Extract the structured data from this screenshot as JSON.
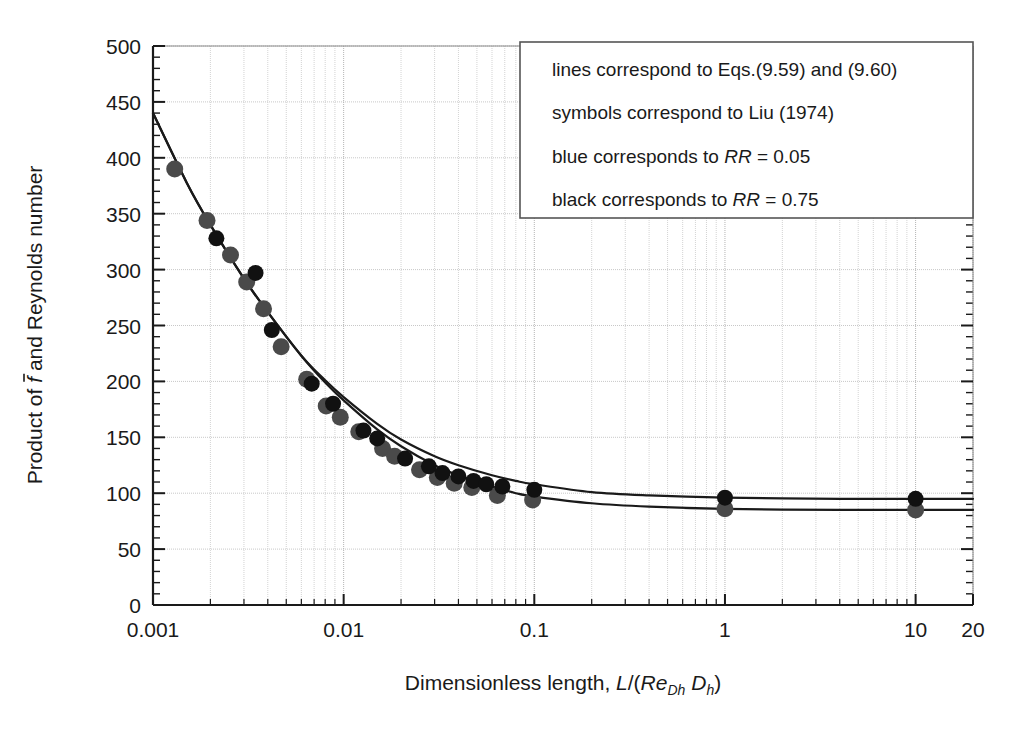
{
  "figure": {
    "background": "#ffffff",
    "plot_area": {
      "left": 153,
      "top": 46,
      "right": 973,
      "bottom": 605
    }
  },
  "chart_data": {
    "type": "scatter",
    "title": "",
    "xlabel": "Dimensionless length, L/(Re_Dh D_h)",
    "ylabel": "Product of f-bar and Reynolds number",
    "xscale": "log",
    "xlim": [
      0.001,
      20
    ],
    "ylim": [
      0,
      500
    ],
    "yticks": [
      0,
      50,
      100,
      150,
      200,
      250,
      300,
      350,
      400,
      450,
      500
    ],
    "ytick_labels": [
      "0",
      "50",
      "100",
      "150",
      "200",
      "250",
      "300",
      "350",
      "400",
      "450",
      "500"
    ],
    "xticks": [
      0.001,
      0.01,
      0.1,
      1,
      10,
      20
    ],
    "xtick_labels": [
      "0.001",
      "0.01",
      "0.1",
      "1",
      "10",
      "20"
    ],
    "grid": true,
    "grid_style": "dotted",
    "grid_color": "#c8c8c8",
    "minor_ticks": true,
    "legend_position": "top-right",
    "series": [
      {
        "name": "RR = 0.05",
        "label": "blue corresponds to RR = 0.05",
        "color": "#4a4a4a",
        "marker": "circle",
        "marker_size": 17,
        "line_color": "#1a1a1a",
        "points": [
          {
            "x": 0.0013,
            "y": 390
          },
          {
            "x": 0.00192,
            "y": 344
          },
          {
            "x": 0.00255,
            "y": 313
          },
          {
            "x": 0.0031,
            "y": 289
          },
          {
            "x": 0.0038,
            "y": 265
          },
          {
            "x": 0.0047,
            "y": 231
          },
          {
            "x": 0.0064,
            "y": 202
          },
          {
            "x": 0.0081,
            "y": 178
          },
          {
            "x": 0.0096,
            "y": 168
          },
          {
            "x": 0.012,
            "y": 155
          },
          {
            "x": 0.016,
            "y": 140
          },
          {
            "x": 0.0185,
            "y": 133
          },
          {
            "x": 0.025,
            "y": 121
          },
          {
            "x": 0.031,
            "y": 114
          },
          {
            "x": 0.038,
            "y": 109
          },
          {
            "x": 0.047,
            "y": 105
          },
          {
            "x": 0.064,
            "y": 98
          },
          {
            "x": 0.098,
            "y": 94
          },
          {
            "x": 1.0,
            "y": 86
          },
          {
            "x": 10.0,
            "y": 85
          }
        ],
        "curve": [
          {
            "x": 0.001,
            "y": 440
          },
          {
            "x": 0.0015,
            "y": 378
          },
          {
            "x": 0.002,
            "y": 340
          },
          {
            "x": 0.003,
            "y": 292
          },
          {
            "x": 0.004,
            "y": 262
          },
          {
            "x": 0.006,
            "y": 223
          },
          {
            "x": 0.008,
            "y": 199
          },
          {
            "x": 0.01,
            "y": 183
          },
          {
            "x": 0.015,
            "y": 157
          },
          {
            "x": 0.02,
            "y": 142
          },
          {
            "x": 0.03,
            "y": 125
          },
          {
            "x": 0.04,
            "y": 116
          },
          {
            "x": 0.06,
            "y": 106
          },
          {
            "x": 0.08,
            "y": 100
          },
          {
            "x": 0.1,
            "y": 97
          },
          {
            "x": 0.2,
            "y": 91
          },
          {
            "x": 0.4,
            "y": 88
          },
          {
            "x": 1.0,
            "y": 86
          },
          {
            "x": 4.0,
            "y": 85
          },
          {
            "x": 10.0,
            "y": 85
          },
          {
            "x": 20.0,
            "y": 85
          }
        ]
      },
      {
        "name": "RR = 0.75",
        "label": "black corresponds to RR = 0.75",
        "color": "#111111",
        "marker": "circle",
        "marker_size": 16,
        "line_color": "#1a1a1a",
        "points": [
          {
            "x": 0.00215,
            "y": 328
          },
          {
            "x": 0.00345,
            "y": 297
          },
          {
            "x": 0.0042,
            "y": 246
          },
          {
            "x": 0.0068,
            "y": 198
          },
          {
            "x": 0.0088,
            "y": 180
          },
          {
            "x": 0.0127,
            "y": 156
          },
          {
            "x": 0.015,
            "y": 149
          },
          {
            "x": 0.021,
            "y": 131
          },
          {
            "x": 0.028,
            "y": 124
          },
          {
            "x": 0.033,
            "y": 118
          },
          {
            "x": 0.04,
            "y": 115
          },
          {
            "x": 0.048,
            "y": 111
          },
          {
            "x": 0.056,
            "y": 108
          },
          {
            "x": 0.068,
            "y": 106
          },
          {
            "x": 0.1,
            "y": 103
          },
          {
            "x": 1.0,
            "y": 96
          },
          {
            "x": 10.0,
            "y": 95
          }
        ],
        "curve": [
          {
            "x": 0.001,
            "y": 440
          },
          {
            "x": 0.0015,
            "y": 378
          },
          {
            "x": 0.002,
            "y": 340
          },
          {
            "x": 0.003,
            "y": 292
          },
          {
            "x": 0.004,
            "y": 262
          },
          {
            "x": 0.006,
            "y": 223
          },
          {
            "x": 0.008,
            "y": 201
          },
          {
            "x": 0.01,
            "y": 186
          },
          {
            "x": 0.015,
            "y": 162
          },
          {
            "x": 0.02,
            "y": 148
          },
          {
            "x": 0.03,
            "y": 133
          },
          {
            "x": 0.04,
            "y": 125
          },
          {
            "x": 0.06,
            "y": 116
          },
          {
            "x": 0.08,
            "y": 111
          },
          {
            "x": 0.1,
            "y": 108
          },
          {
            "x": 0.2,
            "y": 101
          },
          {
            "x": 0.4,
            "y": 98
          },
          {
            "x": 1.0,
            "y": 96
          },
          {
            "x": 4.0,
            "y": 95
          },
          {
            "x": 10.0,
            "y": 95
          },
          {
            "x": 20.0,
            "y": 95
          }
        ]
      }
    ],
    "annotations": [
      "lines correspond to Eqs.(9.59) and (9.60)",
      "symbols correspond to Liu (1974)",
      "blue corresponds to RR = 0.05",
      "black corresponds to RR = 0.75"
    ]
  },
  "legend": {
    "box": {
      "left": 520,
      "top": 42,
      "right": 973,
      "bottom": 218
    },
    "lines": [
      {
        "id": "l1",
        "pre": "lines correspond to Eqs.(9.59) and (9.60)",
        "ital": "",
        "post": ""
      },
      {
        "id": "l2",
        "pre": "symbols correspond to Liu (1974)",
        "ital": "",
        "post": ""
      },
      {
        "id": "l3",
        "pre": "blue corresponds to ",
        "ital": "RR",
        "post": " = 0.05"
      },
      {
        "id": "l4",
        "pre": "black corresponds to ",
        "ital": "RR",
        "post": " = 0.75"
      }
    ]
  },
  "axes": {
    "y_title_parts": {
      "a": "Product of ",
      "f": "f",
      "b": " and Reynolds number"
    },
    "x_title_parts": {
      "a": "Dimensionless length, ",
      "L": "L",
      "slash": "/(",
      "Re": "Re",
      "ReSub": "Dh",
      "space": " ",
      "D": "D",
      "DSub": "h",
      "close": ")"
    }
  }
}
